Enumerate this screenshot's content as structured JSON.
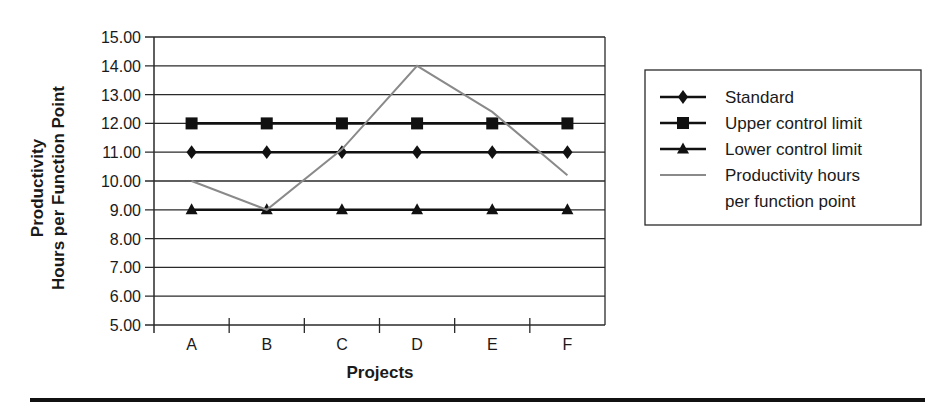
{
  "chart_data": {
    "type": "line",
    "title": "",
    "xlabel": "Projects",
    "ylabel": "Productivity Hours per Function Point",
    "ylabel_lines": [
      "Productivity",
      "Hours per Function Point"
    ],
    "categories": [
      "A",
      "B",
      "C",
      "D",
      "E",
      "F"
    ],
    "ylim": [
      5.0,
      15.0
    ],
    "yticks": [
      "5.00",
      "6.00",
      "7.00",
      "8.00",
      "9.00",
      "10.00",
      "11.00",
      "12.00",
      "13.00",
      "14.00",
      "15.00"
    ],
    "grid": true,
    "legend_position": "right",
    "series": [
      {
        "name": "Standard",
        "marker": "diamond",
        "color": "#111111",
        "values": [
          11,
          11,
          11,
          11,
          11,
          11
        ]
      },
      {
        "name": "Upper control limit",
        "marker": "square",
        "color": "#111111",
        "values": [
          12,
          12,
          12,
          12,
          12,
          12
        ]
      },
      {
        "name": "Lower control limit",
        "marker": "triangle",
        "color": "#111111",
        "values": [
          9,
          9,
          9,
          9,
          9,
          9
        ]
      },
      {
        "name": "Productivity hours per function point",
        "marker": "none",
        "color": "#8a8a8a",
        "values": [
          10.0,
          9.0,
          11.1,
          14.0,
          12.4,
          10.2
        ]
      }
    ]
  },
  "legend": {
    "items": [
      {
        "label_lines": [
          "Standard"
        ]
      },
      {
        "label_lines": [
          "Upper control limit"
        ]
      },
      {
        "label_lines": [
          "Lower control limit"
        ]
      },
      {
        "label_lines": [
          "Productivity hours",
          "per function point"
        ]
      }
    ]
  }
}
